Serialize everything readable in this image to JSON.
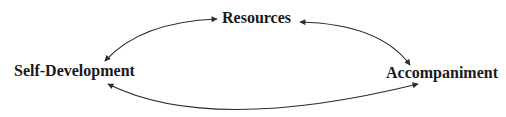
{
  "diagram": {
    "type": "cycle",
    "nodes": [
      {
        "id": "resources",
        "label": "Resources"
      },
      {
        "id": "self_development",
        "label": "Self-Development"
      },
      {
        "id": "accompaniment",
        "label": "Accompaniment"
      }
    ],
    "edges": [
      {
        "from": "resources",
        "to": "self_development",
        "bidirectional": true
      },
      {
        "from": "resources",
        "to": "accompaniment",
        "bidirectional": true
      },
      {
        "from": "self_development",
        "to": "accompaniment",
        "bidirectional": true
      }
    ],
    "colors": {
      "line": "#2b2b2b",
      "text": "#1a1a1a",
      "background": "#ffffff"
    }
  }
}
